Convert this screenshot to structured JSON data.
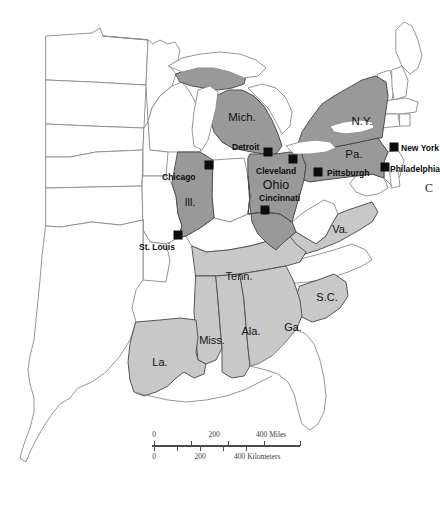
{
  "map": {
    "title": "Eastern United States reference map",
    "background_color": "#ffffff",
    "colors": {
      "highlight_dark": "#999999",
      "highlight_light": "#c8c8c8",
      "unfilled": "#ffffff",
      "border": "#8a8a8a",
      "marker": "#0d0d0d",
      "label_text": "#111111"
    },
    "edge_clipped_letter": "C",
    "state_labels": [
      {
        "name": "Mich.",
        "x": 242,
        "y": 117,
        "size": 11.5,
        "fill": "dark"
      },
      {
        "name": "N.Y.",
        "x": 362,
        "y": 121,
        "size": 11.5,
        "fill": "dark"
      },
      {
        "name": "Pa.",
        "x": 354,
        "y": 154,
        "size": 11.5,
        "fill": "dark"
      },
      {
        "name": "Ohio",
        "x": 276,
        "y": 185,
        "size": 12.5,
        "fill": "dark"
      },
      {
        "name": "Ill.",
        "x": 190,
        "y": 202,
        "size": 11.0,
        "fill": "dark"
      },
      {
        "name": "Va.",
        "x": 340,
        "y": 229,
        "size": 11.0,
        "fill": "light"
      },
      {
        "name": "Tenn.",
        "x": 239,
        "y": 276,
        "size": 11.0,
        "fill": "light"
      },
      {
        "name": "S.C.",
        "x": 327,
        "y": 297,
        "size": 11.0,
        "fill": "light"
      },
      {
        "name": "Miss.",
        "x": 212,
        "y": 340,
        "size": 11.0,
        "fill": "light"
      },
      {
        "name": "Ala.",
        "x": 251,
        "y": 331,
        "size": 11.0,
        "fill": "light"
      },
      {
        "name": "Ga.",
        "x": 293,
        "y": 327,
        "size": 11.0,
        "fill": "light"
      },
      {
        "name": "La.",
        "x": 160,
        "y": 362,
        "size": 11.0,
        "fill": "light"
      }
    ],
    "cities": [
      {
        "name": "Chicago",
        "marker_x": 209,
        "marker_y": 165,
        "label_x": 162,
        "label_y": 172
      },
      {
        "name": "Detroit",
        "marker_x": 268,
        "marker_y": 152,
        "label_x": 232,
        "label_y": 142
      },
      {
        "name": "Cleveland",
        "marker_x": 293,
        "marker_y": 159,
        "label_x": 256,
        "label_y": 166
      },
      {
        "name": "Cincinnati",
        "marker_x": 265,
        "marker_y": 210,
        "label_x": 259,
        "label_y": 193
      },
      {
        "name": "St. Louis",
        "marker_x": 178,
        "marker_y": 235,
        "label_x": 139,
        "label_y": 242
      },
      {
        "name": "Pittsburgh",
        "marker_x": 318,
        "marker_y": 172,
        "label_x": 327,
        "label_y": 168
      },
      {
        "name": "New York",
        "marker_x": 394,
        "marker_y": 147,
        "label_x": 401,
        "label_y": 143
      },
      {
        "name": "Philadelphia",
        "marker_x": 385,
        "marker_y": 167,
        "label_x": 390,
        "label_y": 164
      }
    ],
    "scale": {
      "miles": {
        "ticks": [
          "0",
          "200",
          "400"
        ],
        "unit": "Miles",
        "unit_label": "400 Miles"
      },
      "kilometers": {
        "ticks": [
          "0",
          "200",
          "400"
        ],
        "unit": "Kilometers",
        "unit_label": "400 Kilometers"
      }
    }
  }
}
